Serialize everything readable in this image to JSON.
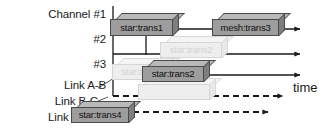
{
  "figure": {
    "kind": "timeline-gantt-diagram",
    "background": "#ffffff",
    "ink": "#1a1a1a",
    "block_fill": "#9d9d9d",
    "block_top": "#b9b9b9",
    "block_side": "#7e7e7e",
    "ghost_fill": "#eeeeee",
    "time_axis_label": "time"
  },
  "rows": [
    {
      "id": "ch1",
      "label": "Channel #1",
      "label_x": 30,
      "label_y": 8,
      "label_w": 76,
      "axis_y": 29,
      "style": "solid",
      "arrow_end": 300
    },
    {
      "id": "ch2",
      "label": "#2",
      "label_x": 30,
      "label_y": 33,
      "label_w": 76,
      "axis_y": 54,
      "style": "solid",
      "arrow_end": 300
    },
    {
      "id": "ch3",
      "label": "#3",
      "label_x": 30,
      "label_y": 58,
      "label_w": 76,
      "axis_y": 75,
      "style": "solid",
      "arrow_end": 300
    },
    {
      "id": "linkab",
      "label": "Link A-B",
      "label_x": 26,
      "label_y": 79,
      "label_w": 80,
      "axis_y": 96,
      "style": "dashed",
      "arrow_end": 283
    },
    {
      "id": "linkbc",
      "label": "Link B-C",
      "label_x": 18,
      "label_y": 95,
      "label_w": 80,
      "axis_y": 112,
      "style": "dashed",
      "arrow_end": 268
    },
    {
      "id": "linkcd",
      "label": "Link C-D",
      "label_x": 12,
      "label_y": 111,
      "label_w": 80,
      "axis_y": 128,
      "style": "none",
      "arrow_end": 0
    }
  ],
  "time_label": {
    "text": "time",
    "x": 293,
    "y": 80
  },
  "vertical_guides": [
    {
      "id": "guide-origin",
      "x": 113,
      "y1": 6,
      "y2": 96
    },
    {
      "id": "guide-start2",
      "x": 146,
      "y1": 30,
      "y2": 55
    }
  ],
  "blocks": [
    {
      "id": "block-star-trans1",
      "label": "star:trans1",
      "x": 110,
      "y": 13,
      "w": 63,
      "h": 17,
      "depth": 6,
      "ghost": false
    },
    {
      "id": "block-mesh-trans3",
      "label": "mesh:trans3",
      "x": 212,
      "y": 13,
      "w": 67,
      "h": 17,
      "depth": 6,
      "ghost": false
    },
    {
      "id": "block-star-trans2",
      "label": "star:trans2",
      "x": 142,
      "y": 60,
      "w": 62,
      "h": 16,
      "depth": 6,
      "ghost": false
    },
    {
      "id": "block-star-trans4",
      "label": "star:trans4",
      "x": 71,
      "y": 101,
      "w": 58,
      "h": 16,
      "depth": 6,
      "ghost": false
    },
    {
      "id": "ghost-star-trans2-ch2",
      "label": "star:trans2",
      "x": 160,
      "y": 36,
      "w": 62,
      "h": 16,
      "depth": 6,
      "ghost": true
    },
    {
      "id": "ghost-star-trans-ch3",
      "label": "star:trans",
      "x": 112,
      "y": 58,
      "w": 56,
      "h": 16,
      "depth": 6,
      "ghost": true
    },
    {
      "id": "ghost-block-lower",
      "label": "",
      "x": 138,
      "y": 78,
      "w": 72,
      "h": 16,
      "depth": 6,
      "ghost": true
    }
  ],
  "leader_lines": [
    {
      "id": "leader-link-ab",
      "x1": 98,
      "y1": 88,
      "x2": 114,
      "y2": 78
    },
    {
      "id": "leader-link-bc",
      "x1": 93,
      "y1": 103,
      "x2": 108,
      "y2": 97
    },
    {
      "id": "leader-link-cd",
      "x1": 72,
      "y1": 122,
      "x2": 86,
      "y2": 112
    }
  ]
}
